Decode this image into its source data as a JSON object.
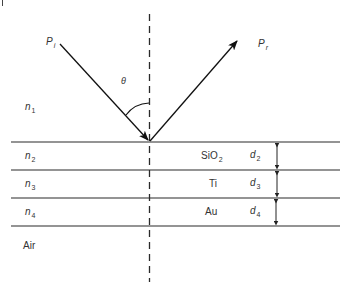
{
  "diagram": {
    "type": "thin-film reflection schematic",
    "colors": {
      "line": "#2a2a2a",
      "text": "#333333",
      "background": "#ffffff"
    },
    "rays": {
      "incident": {
        "symbol": "P",
        "subscript": "i"
      },
      "reflected": {
        "symbol": "P",
        "subscript": "r"
      }
    },
    "angle": {
      "label": "θ"
    },
    "ambient_medium": {
      "symbol": "n",
      "subscript": "1"
    },
    "layers": [
      {
        "index_symbol": "n",
        "index_subscript": "2",
        "material": "SiO",
        "material_subscript": "2",
        "thickness_symbol": "d",
        "thickness_subscript": "2"
      },
      {
        "index_symbol": "n",
        "index_subscript": "3",
        "material": "Ti",
        "material_subscript": "",
        "thickness_symbol": "d",
        "thickness_subscript": "3"
      },
      {
        "index_symbol": "n",
        "index_subscript": "4",
        "material": "Au",
        "material_subscript": "",
        "thickness_symbol": "d",
        "thickness_subscript": "4"
      }
    ],
    "substrate": {
      "label": "Air"
    }
  }
}
